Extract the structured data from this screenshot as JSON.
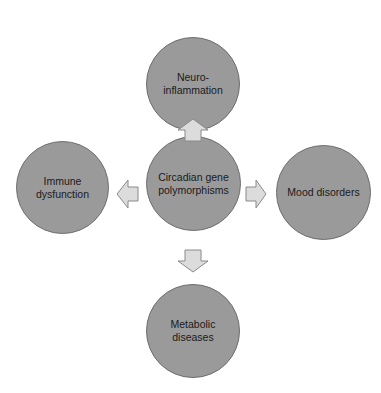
{
  "diagram": {
    "center": {
      "label": "Circadian gene\npolymorphisms"
    },
    "nodes": [
      {
        "id": "top",
        "label": "Neuro-\ninflammation"
      },
      {
        "id": "left",
        "label": "Immune\ndysfunction"
      },
      {
        "id": "right",
        "label": "Mood disorders"
      },
      {
        "id": "bottom",
        "label": "Metabolic\ndiseases"
      }
    ],
    "arrows": [
      "center->top",
      "center->left",
      "center->right",
      "center->bottom"
    ],
    "colors": {
      "node_fill": "#9a9a9a",
      "node_border": "#6e6e6e",
      "arrow_fill": "#dcdcdc",
      "arrow_border": "#8a8a8a"
    }
  }
}
